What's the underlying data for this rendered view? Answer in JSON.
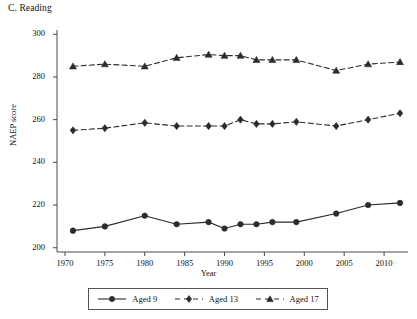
{
  "chart_data": {
    "type": "line",
    "title": "C. Reading",
    "xlabel": "Year",
    "ylabel": "NAEP score",
    "xlim": [
      1969,
      2013
    ],
    "ylim": [
      198,
      302
    ],
    "ytick_labels": [
      "300",
      "280",
      "260",
      "240",
      "220",
      "200"
    ],
    "yticks": [
      300,
      280,
      260,
      240,
      220,
      200
    ],
    "xtick_labels": [
      "1970",
      "1975",
      "1980",
      "1985",
      "1990",
      "1995",
      "2000",
      "2005",
      "2010"
    ],
    "xticks": [
      1970,
      1975,
      1980,
      1985,
      1990,
      1995,
      2000,
      2005,
      2010
    ],
    "grid": false,
    "legend_position": "below-axes",
    "series": [
      {
        "name": "Aged 9",
        "marker": "circle",
        "linestyle": "solid",
        "color": "#2b2b2b",
        "x": [
          1971,
          1975,
          1980,
          1984,
          1988,
          1990,
          1992,
          1994,
          1996,
          1999,
          2004,
          2008,
          2012
        ],
        "values": [
          208,
          210,
          215,
          211,
          212,
          209,
          211,
          211,
          212,
          212,
          216,
          220,
          221
        ]
      },
      {
        "name": "Aged 13",
        "marker": "diamond",
        "linestyle": "dashed",
        "color": "#2b2b2b",
        "x": [
          1971,
          1975,
          1980,
          1984,
          1988,
          1990,
          1992,
          1994,
          1996,
          1999,
          2004,
          2008,
          2012
        ],
        "values": [
          255,
          256,
          258.5,
          257,
          257,
          257,
          260,
          258,
          258,
          259,
          257,
          260,
          263
        ]
      },
      {
        "name": "Aged 17",
        "marker": "triangle",
        "linestyle": "dashed",
        "color": "#2b2b2b",
        "x": [
          1971,
          1975,
          1980,
          1984,
          1988,
          1990,
          1992,
          1994,
          1996,
          1999,
          2004,
          2008,
          2012
        ],
        "values": [
          285,
          286,
          285,
          289,
          290.5,
          290,
          290,
          288,
          288,
          288,
          283,
          286,
          287
        ]
      }
    ]
  },
  "legend": {
    "items": [
      {
        "label": "Aged 9",
        "marker": "circle",
        "linestyle": "solid"
      },
      {
        "label": "Aged 13",
        "marker": "diamond",
        "linestyle": "dashed"
      },
      {
        "label": "Aged 17",
        "marker": "triangle",
        "linestyle": "dashed"
      }
    ]
  }
}
